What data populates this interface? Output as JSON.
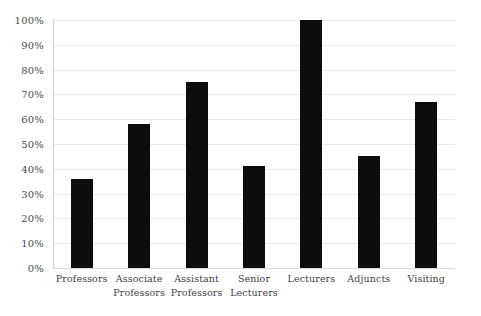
{
  "chart_data": {
    "type": "bar",
    "title": "",
    "subtitle": "",
    "xlabel": "",
    "ylabel": "",
    "categories": [
      "Professors",
      "Associate Professors",
      "Assistant Professors",
      "Senior Lecturers",
      "Lecturers",
      "Adjuncts",
      "Visiting"
    ],
    "category_lines": [
      [
        "Professors"
      ],
      [
        "Associate",
        "Professors"
      ],
      [
        "Assistant",
        "Professors"
      ],
      [
        "Senior",
        "Lecturers"
      ],
      [
        "Lecturers"
      ],
      [
        "Adjuncts"
      ],
      [
        "Visiting"
      ]
    ],
    "values": [
      36,
      58,
      75,
      41,
      100,
      45,
      67
    ],
    "value_labels": [
      "36%",
      "58%",
      "75%",
      "41%",
      "100%",
      "45%",
      "67%"
    ],
    "ylim": [
      0,
      100
    ],
    "ytick_step": 10,
    "ytick_labels": [
      "100%",
      "90%",
      "80%",
      "70%",
      "60%",
      "50%",
      "40%",
      "30%",
      "20%",
      "10%",
      "0%"
    ],
    "ytick_values": [
      100,
      90,
      80,
      70,
      60,
      50,
      40,
      30,
      20,
      10,
      0
    ],
    "grid": {
      "horizontal": true,
      "vertical": false,
      "color": "#e9e9e9"
    },
    "legend": {
      "visible": false,
      "position": "none",
      "entries": []
    },
    "colors": {
      "bar": "#0d0d0d",
      "background": "#ffffff",
      "gridline": "#e9e9e9",
      "axis_line": "#d6d6d6",
      "tick_text": "#4a4a4a",
      "category_text": "#3f3f3f"
    }
  }
}
